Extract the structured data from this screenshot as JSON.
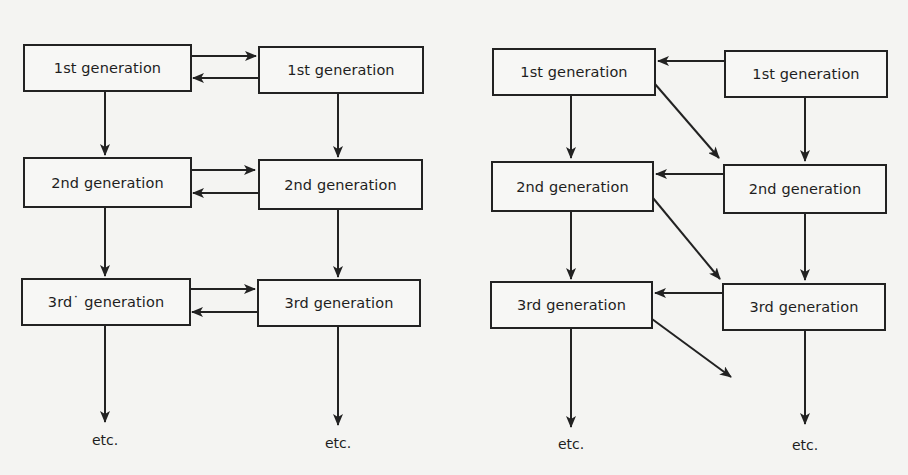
{
  "figure": {
    "background_color": "#f4f4f2",
    "line_color": "#222222",
    "panels": [
      {
        "id": "left",
        "description": "Two parallel generation chains with bidirectional exchange at each generation",
        "columns": [
          {
            "id": "left-col-a",
            "boxes": [
              {
                "label": "1st generation"
              },
              {
                "label": "2nd generation"
              },
              {
                "label": "3rd˙ generation"
              }
            ],
            "continuation": "etc."
          },
          {
            "id": "left-col-b",
            "boxes": [
              {
                "label": "1st generation"
              },
              {
                "label": "2nd generation"
              },
              {
                "label": "3rd generation"
              }
            ],
            "continuation": "etc."
          }
        ],
        "edges": [
          {
            "from": "A1",
            "to": "B1",
            "type": "horizontal-right"
          },
          {
            "from": "B1",
            "to": "A1",
            "type": "horizontal-left"
          },
          {
            "from": "A2",
            "to": "B2",
            "type": "horizontal-right"
          },
          {
            "from": "B2",
            "to": "A2",
            "type": "horizontal-left"
          },
          {
            "from": "A3",
            "to": "B3",
            "type": "horizontal-right"
          },
          {
            "from": "B3",
            "to": "A3",
            "type": "horizontal-left"
          },
          {
            "from": "A1",
            "to": "A2",
            "type": "vertical"
          },
          {
            "from": "A2",
            "to": "A3",
            "type": "vertical"
          },
          {
            "from": "A3",
            "to": "etc",
            "type": "vertical"
          },
          {
            "from": "B1",
            "to": "B2",
            "type": "vertical"
          },
          {
            "from": "B2",
            "to": "B3",
            "type": "vertical"
          },
          {
            "from": "B3",
            "to": "etc",
            "type": "vertical"
          }
        ]
      },
      {
        "id": "right",
        "description": "Two chains with B→A exchange within a generation and A(n)→B(n+1) diagonal transfer",
        "columns": [
          {
            "id": "right-col-a",
            "boxes": [
              {
                "label": "1st generation"
              },
              {
                "label": "2nd generation"
              },
              {
                "label": "3rd generation"
              }
            ],
            "continuation": "etc."
          },
          {
            "id": "right-col-b",
            "boxes": [
              {
                "label": "1st generation"
              },
              {
                "label": "2nd generation"
              },
              {
                "label": "3rd generation"
              }
            ],
            "continuation": "etc."
          }
        ],
        "edges": [
          {
            "from": "B1",
            "to": "A1",
            "type": "horizontal-left"
          },
          {
            "from": "B2",
            "to": "A2",
            "type": "horizontal-left"
          },
          {
            "from": "B3",
            "to": "A3",
            "type": "horizontal-left"
          },
          {
            "from": "A1",
            "to": "B2",
            "type": "diagonal"
          },
          {
            "from": "A2",
            "to": "B3",
            "type": "diagonal"
          },
          {
            "from": "A3",
            "to": "open",
            "type": "diagonal"
          },
          {
            "from": "A1",
            "to": "A2",
            "type": "vertical"
          },
          {
            "from": "A2",
            "to": "A3",
            "type": "vertical"
          },
          {
            "from": "A3",
            "to": "etc",
            "type": "vertical"
          },
          {
            "from": "B1",
            "to": "B2",
            "type": "vertical"
          },
          {
            "from": "B2",
            "to": "B3",
            "type": "vertical"
          },
          {
            "from": "B3",
            "to": "etc",
            "type": "vertical"
          }
        ]
      }
    ]
  }
}
